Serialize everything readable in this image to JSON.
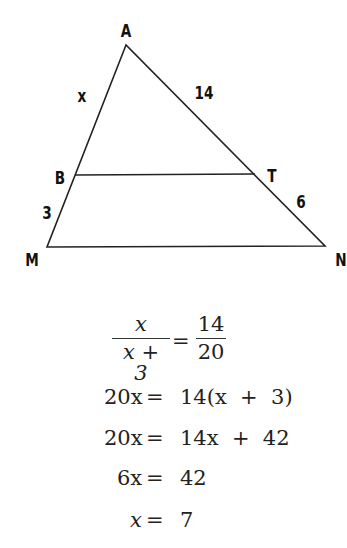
{
  "diagram": {
    "type": "triangle-with-parallel-segment",
    "vertices": {
      "A": {
        "label": "A"
      },
      "B": {
        "label": "B"
      },
      "T": {
        "label": "T"
      },
      "M": {
        "label": "M"
      },
      "N": {
        "label": "N"
      }
    },
    "segment_labels": {
      "AB": "x",
      "AT": "14",
      "BM": "3",
      "TN": "6"
    },
    "line_color": "#222222"
  },
  "solution": {
    "proportion": {
      "left_num": "x",
      "left_den": "x + 3",
      "equals": "=",
      "right_num": "14",
      "right_den": "20"
    },
    "steps": [
      {
        "lhs": "20x",
        "rhs": "14(x  +  3)"
      },
      {
        "lhs": "20x",
        "rhs": "14x  +  42"
      },
      {
        "lhs": "6x",
        "rhs": "42"
      },
      {
        "lhs": "x",
        "rhs": "7"
      }
    ]
  }
}
